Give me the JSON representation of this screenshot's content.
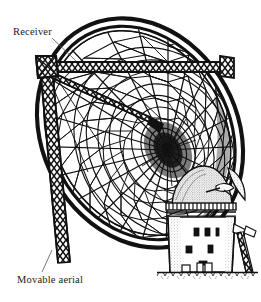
{
  "figure": {
    "kind": "line-engraving",
    "background_color": "#ffffff",
    "ink_color": "#111111"
  },
  "annotations": {
    "receiver": {
      "label": "Receiver",
      "leader": "thin diagonal line from text down-right to the receiver apex of the support truss"
    },
    "movable_aerial": {
      "label": "Movable aerial",
      "leader": "thin diagonal line from text up-right to the lower rim of the dish"
    }
  },
  "parts": {
    "dish": "large elliptical parabolic mesh reflector, radial ribs and concentric hoops, dark thick rim band",
    "hub": "dark convergence vertex near centre of dish",
    "receiver_truss": "lattice horizontal beam and diagonal leg meeting at receiver apex",
    "building": "stone tower windmill with cap, fantail vane, three rows of windows, doorway, stippled shading",
    "ground": "hatched grass ground line beneath the building"
  },
  "colors": {
    "ink": "#111111",
    "paper": "#ffffff",
    "stipple": "#6f6f6f"
  }
}
